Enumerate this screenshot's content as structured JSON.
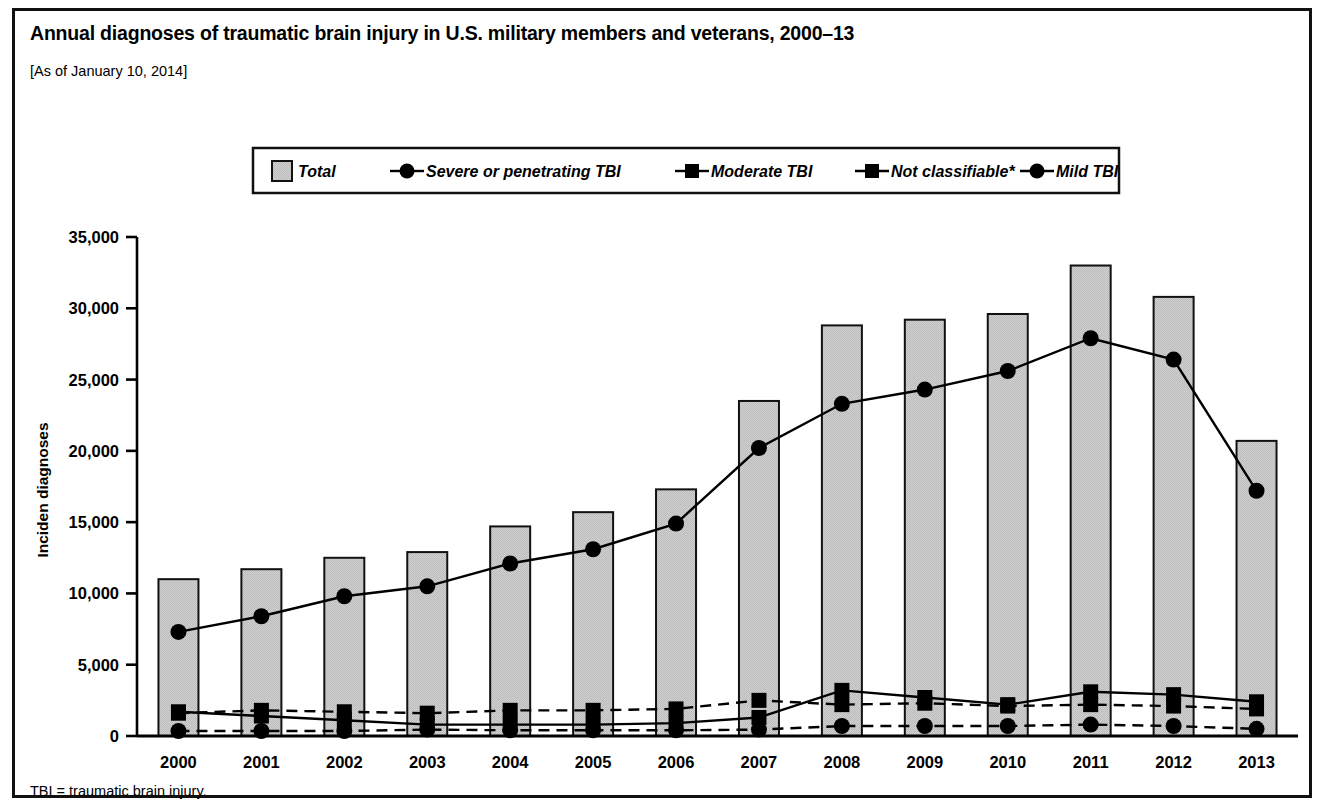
{
  "header": {
    "title": "Annual diagnoses of traumatic brain injury in U.S. military members and veterans, 2000–13",
    "subtitle": "[As of January 10, 2014]"
  },
  "footnote": {
    "text": "TBI = traumatic brain injury."
  },
  "legend": {
    "items": [
      {
        "label": "Total",
        "marker": "filled-square-swatch",
        "line": "none",
        "color": "#c8c8c8"
      },
      {
        "label": "Severe or penetrating TBI",
        "marker": "circle",
        "line": "dashed",
        "color": "#000000"
      },
      {
        "label": "Moderate TBI",
        "marker": "square",
        "line": "dashed",
        "color": "#000000"
      },
      {
        "label": "Not classifiable*",
        "marker": "square",
        "line": "solid",
        "color": "#000000"
      },
      {
        "label": "Mild TBI",
        "marker": "circle",
        "line": "solid",
        "color": "#000000"
      }
    ]
  },
  "chart_data": {
    "type": "bar",
    "title": "Annual diagnoses of traumatic brain injury in U.S. military members and veterans, 2000–13",
    "subtitle": "[As of January 10, 2014]",
    "xlabel": "",
    "ylabel": "Inciden diagnoses",
    "categories": [
      "2000",
      "2001",
      "2002",
      "2003",
      "2004",
      "2005",
      "2006",
      "2007",
      "2008",
      "2009",
      "2010",
      "2011",
      "2012",
      "2013"
    ],
    "ylim": [
      0,
      35000
    ],
    "yticks": [
      0,
      5000,
      10000,
      15000,
      20000,
      25000,
      30000,
      35000
    ],
    "ytick_labels": [
      "0",
      "5,000",
      "10,000",
      "15,000",
      "20,000",
      "25,000",
      "30,000",
      "35,000"
    ],
    "grid": false,
    "legend_position": "top-center",
    "series": [
      {
        "name": "Total",
        "type": "bar",
        "values": [
          11000,
          11700,
          12500,
          12900,
          14700,
          15700,
          17300,
          23500,
          28800,
          29200,
          29600,
          33000,
          30800,
          20700
        ]
      },
      {
        "name": "Mild TBI",
        "type": "line",
        "line": "solid",
        "marker": "circle",
        "values": [
          7300,
          8400,
          9800,
          10500,
          12100,
          13100,
          14900,
          20200,
          23300,
          24300,
          25600,
          27900,
          26400,
          17200
        ]
      },
      {
        "name": "Not classifiable*",
        "type": "line",
        "line": "solid",
        "marker": "square",
        "values": [
          1700,
          1400,
          1100,
          800,
          800,
          800,
          900,
          1300,
          3200,
          2700,
          2200,
          3100,
          2900,
          2400
        ]
      },
      {
        "name": "Moderate TBI",
        "type": "line",
        "line": "dashed",
        "marker": "square",
        "values": [
          1600,
          1800,
          1700,
          1600,
          1800,
          1800,
          1900,
          2500,
          2200,
          2300,
          2100,
          2200,
          2100,
          1900
        ]
      },
      {
        "name": "Severe or penetrating TBI",
        "type": "line",
        "line": "dashed",
        "marker": "circle",
        "values": [
          350,
          350,
          350,
          450,
          400,
          400,
          400,
          450,
          700,
          700,
          700,
          800,
          700,
          500
        ]
      }
    ],
    "annotations": [
      "TBI = traumatic brain injury."
    ]
  }
}
